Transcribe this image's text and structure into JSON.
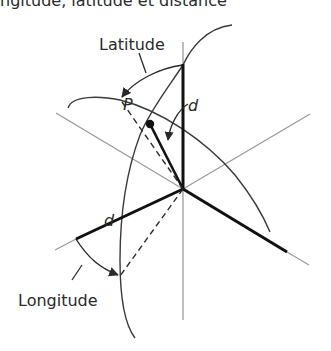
{
  "caption": "ngitude, latitude et distance",
  "labels": {
    "latitude": "Latitude",
    "longitude": "Longitude",
    "point": "P",
    "distance_vertical": "d",
    "distance_horizontal": "d"
  },
  "colors": {
    "ink": "#2a2a2a",
    "axis_gray": "#9a9a9a",
    "background": "#ffffff"
  }
}
